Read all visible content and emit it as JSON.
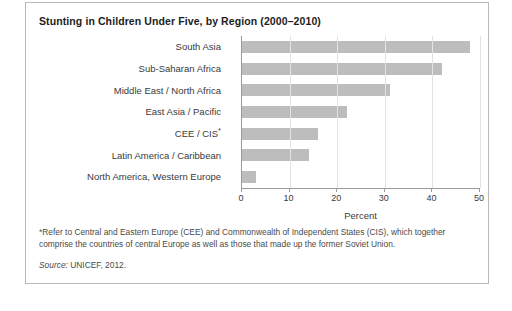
{
  "figure": {
    "title": "Stunting in Children Under Five, by Region (2000–2010)",
    "footnote": "*Refer to Central and Eastern Europe (CEE) and Commonwealth of Independent States (CIS), which together comprise the countries of central Europe as well as those that made up the former Soviet Union.",
    "source_label": "Source:",
    "source_text": "UNICEF, 2012.",
    "bar_color": "#bdbdbd",
    "border_color": "#b9b9b9"
  },
  "chart_data": {
    "type": "bar",
    "orientation": "horizontal",
    "title": "Stunting in Children Under Five, by Region (2000–2010)",
    "xlabel": "Percent",
    "ylabel": "",
    "xlim": [
      0,
      50
    ],
    "xticks": [
      0,
      10,
      20,
      30,
      40,
      50
    ],
    "xtick_labels": [
      "0",
      "10",
      "20",
      "30",
      "40",
      "50"
    ],
    "grid": "vertical",
    "legend": "none",
    "categories": [
      "South Asia",
      "Sub-Saharan Africa",
      "Middle East / North Africa",
      "East Asia / Pacific",
      "CEE / CIS*",
      "Latin America / Caribbean",
      "North America, Western Europe"
    ],
    "values": [
      48,
      42,
      31,
      22,
      16,
      14,
      3
    ],
    "series": [
      {
        "name": "Percent stunted",
        "values": [
          48,
          42,
          31,
          22,
          16,
          14,
          3
        ]
      }
    ]
  }
}
